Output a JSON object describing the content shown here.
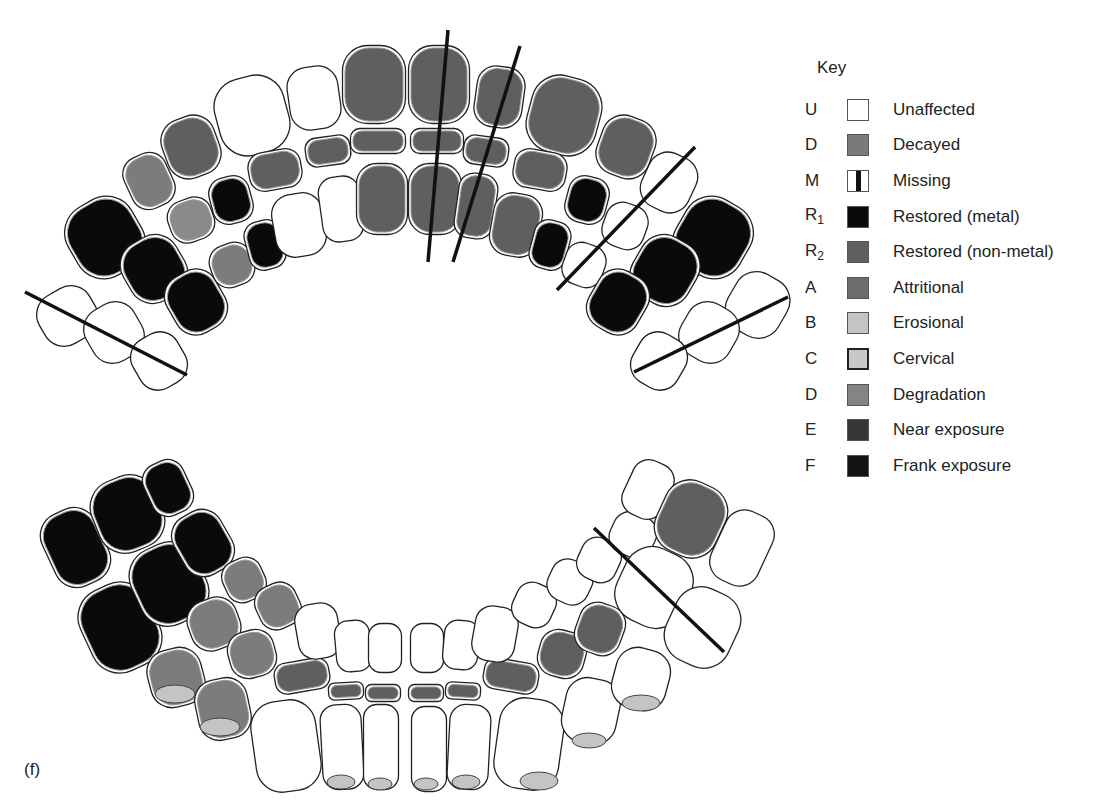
{
  "figure": {
    "panel_label": "(f)"
  },
  "legend": {
    "title": "Key",
    "items": [
      {
        "code": "U",
        "sub": "",
        "label": "Unaffected",
        "color": "#ffffff",
        "pattern": "outline"
      },
      {
        "code": "D",
        "sub": "",
        "label": "Decayed",
        "color": "#7a7a7a",
        "pattern": "solid"
      },
      {
        "code": "M",
        "sub": "",
        "label": "Missing",
        "color": "#ffffff",
        "pattern": "bar"
      },
      {
        "code": "R",
        "sub": "1",
        "label": "Restored (metal)",
        "color": "#0a0a0a",
        "pattern": "solid"
      },
      {
        "code": "R",
        "sub": "2",
        "label": "Restored (non-metal)",
        "color": "#5e5e5e",
        "pattern": "solid"
      },
      {
        "code": "A",
        "sub": "",
        "label": "Attritional",
        "color": "#6c6c6c",
        "pattern": "solid"
      },
      {
        "code": "B",
        "sub": "",
        "label": "Erosional",
        "color": "#c4c4c4",
        "pattern": "solid"
      },
      {
        "code": "C",
        "sub": "",
        "label": "Cervical",
        "color": "#c8c8c8",
        "pattern": "bordered"
      },
      {
        "code": "D",
        "sub": "",
        "label": "Degradation",
        "color": "#848484",
        "pattern": "solid"
      },
      {
        "code": "E",
        "sub": "",
        "label": "Near exposure",
        "color": "#363636",
        "pattern": "solid"
      },
      {
        "code": "F",
        "sub": "",
        "label": "Frank exposure",
        "color": "#121212",
        "pattern": "solid"
      }
    ]
  },
  "colors": {
    "outline": "#222222",
    "decayed": "#5f5f5f",
    "metal": "#0a0a0a",
    "erosional": "#c4c4c4",
    "attritional": "#7c7c7c",
    "missing_line": "#111111"
  },
  "upper_arch": {
    "teeth": [
      {
        "x": 40,
        "y": 290,
        "w": 55,
        "h": 52,
        "r": -30,
        "fill": "#ffffff"
      },
      {
        "x": 88,
        "y": 305,
        "w": 52,
        "h": 55,
        "r": -30,
        "fill": "#ffffff"
      },
      {
        "x": 135,
        "y": 335,
        "w": 48,
        "h": 52,
        "r": -30,
        "fill": "#ffffff"
      },
      {
        "x": 70,
        "y": 200,
        "w": 70,
        "h": 75,
        "r": -30,
        "fill": "#0a0a0a"
      },
      {
        "x": 125,
        "y": 238,
        "w": 58,
        "h": 62,
        "r": -30,
        "fill": "#0a0a0a"
      },
      {
        "x": 170,
        "y": 272,
        "w": 52,
        "h": 60,
        "r": -30,
        "fill": "#0a0a0a"
      },
      {
        "x": 128,
        "y": 155,
        "w": 42,
        "h": 52,
        "r": -25,
        "fill": "#7c7c7c"
      },
      {
        "x": 170,
        "y": 200,
        "w": 42,
        "h": 40,
        "r": -20,
        "fill": "#8a8a8a"
      },
      {
        "x": 212,
        "y": 245,
        "w": 40,
        "h": 40,
        "r": -20,
        "fill": "#7c7c7c"
      },
      {
        "x": 165,
        "y": 118,
        "w": 52,
        "h": 58,
        "r": -20,
        "fill": "#5f5f5f"
      },
      {
        "x": 212,
        "y": 178,
        "w": 38,
        "h": 44,
        "r": -15,
        "fill": "#0a0a0a"
      },
      {
        "x": 248,
        "y": 222,
        "w": 34,
        "h": 46,
        "r": -15,
        "fill": "#0a0a0a"
      },
      {
        "x": 218,
        "y": 78,
        "w": 68,
        "h": 75,
        "r": -15,
        "fill": "#ffffff"
      },
      {
        "x": 250,
        "y": 152,
        "w": 50,
        "h": 36,
        "r": -10,
        "fill": "#5f5f5f"
      },
      {
        "x": 275,
        "y": 195,
        "w": 48,
        "h": 60,
        "r": -10,
        "fill": "#ffffff"
      },
      {
        "x": 290,
        "y": 68,
        "w": 48,
        "h": 60,
        "r": -8,
        "fill": "#ffffff"
      },
      {
        "x": 307,
        "y": 138,
        "w": 42,
        "h": 26,
        "r": -8,
        "fill": "#5f5f5f"
      },
      {
        "x": 322,
        "y": 178,
        "w": 38,
        "h": 62,
        "r": -8,
        "fill": "#ffffff"
      },
      {
        "x": 344,
        "y": 47,
        "w": 60,
        "h": 75,
        "r": 0,
        "fill": "#5f5f5f"
      },
      {
        "x": 352,
        "y": 130,
        "w": 52,
        "h": 22,
        "r": 0,
        "fill": "#5f5f5f"
      },
      {
        "x": 358,
        "y": 165,
        "w": 48,
        "h": 68,
        "r": 0,
        "fill": "#5f5f5f"
      },
      {
        "x": 410,
        "y": 47,
        "w": 58,
        "h": 75,
        "r": 0,
        "fill": "#5f5f5f"
      },
      {
        "x": 412,
        "y": 130,
        "w": 50,
        "h": 22,
        "r": 0,
        "fill": "#5f5f5f"
      },
      {
        "x": 410,
        "y": 165,
        "w": 50,
        "h": 68,
        "r": 0,
        "fill": "#5f5f5f"
      },
      {
        "x": 477,
        "y": 68,
        "w": 45,
        "h": 58,
        "r": 8,
        "fill": "#5f5f5f"
      },
      {
        "x": 465,
        "y": 138,
        "w": 42,
        "h": 26,
        "r": 8,
        "fill": "#5f5f5f"
      },
      {
        "x": 458,
        "y": 175,
        "w": 36,
        "h": 62,
        "r": 8,
        "fill": "#5f5f5f"
      },
      {
        "x": 530,
        "y": 78,
        "w": 68,
        "h": 75,
        "r": 15,
        "fill": "#5f5f5f"
      },
      {
        "x": 515,
        "y": 152,
        "w": 50,
        "h": 36,
        "r": 10,
        "fill": "#5f5f5f"
      },
      {
        "x": 493,
        "y": 195,
        "w": 46,
        "h": 60,
        "r": 10,
        "fill": "#5f5f5f"
      },
      {
        "x": 600,
        "y": 118,
        "w": 52,
        "h": 58,
        "r": 20,
        "fill": "#5f5f5f"
      },
      {
        "x": 568,
        "y": 178,
        "w": 38,
        "h": 44,
        "r": 15,
        "fill": "#0a0a0a"
      },
      {
        "x": 533,
        "y": 222,
        "w": 34,
        "h": 46,
        "r": 15,
        "fill": "#0a0a0a"
      },
      {
        "x": 645,
        "y": 155,
        "w": 48,
        "h": 55,
        "r": 25,
        "fill": "#ffffff"
      },
      {
        "x": 605,
        "y": 205,
        "w": 40,
        "h": 42,
        "r": 20,
        "fill": "#ffffff"
      },
      {
        "x": 565,
        "y": 245,
        "w": 38,
        "h": 40,
        "r": 20,
        "fill": "#ffffff"
      },
      {
        "x": 678,
        "y": 200,
        "w": 70,
        "h": 75,
        "r": 30,
        "fill": "#0a0a0a"
      },
      {
        "x": 635,
        "y": 238,
        "w": 60,
        "h": 65,
        "r": 30,
        "fill": "#0a0a0a"
      },
      {
        "x": 592,
        "y": 272,
        "w": 52,
        "h": 60,
        "r": 30,
        "fill": "#0a0a0a"
      },
      {
        "x": 730,
        "y": 275,
        "w": 55,
        "h": 60,
        "r": 30,
        "fill": "#ffffff"
      },
      {
        "x": 683,
        "y": 305,
        "w": 52,
        "h": 55,
        "r": 30,
        "fill": "#ffffff"
      },
      {
        "x": 635,
        "y": 335,
        "w": 48,
        "h": 52,
        "r": 30,
        "fill": "#ffffff"
      }
    ],
    "missing_lines": [
      {
        "x1": 25,
        "y1": 292,
        "x2": 187,
        "y2": 375
      },
      {
        "x1": 448,
        "y1": 30,
        "x2": 428,
        "y2": 262
      },
      {
        "x1": 520,
        "y1": 46,
        "x2": 453,
        "y2": 262
      },
      {
        "x1": 695,
        "y1": 147,
        "x2": 557,
        "y2": 290
      },
      {
        "x1": 788,
        "y1": 297,
        "x2": 634,
        "y2": 372
      }
    ]
  },
  "lower_arch": {
    "teeth": [
      {
        "x": 48,
        "y": 510,
        "w": 55,
        "h": 75,
        "r": -25,
        "fill": "#0a0a0a"
      },
      {
        "x": 95,
        "y": 478,
        "w": 65,
        "h": 72,
        "r": -22,
        "fill": "#0a0a0a"
      },
      {
        "x": 148,
        "y": 462,
        "w": 40,
        "h": 52,
        "r": -25,
        "fill": "#0a0a0a"
      },
      {
        "x": 85,
        "y": 585,
        "w": 70,
        "h": 85,
        "r": -25,
        "fill": "#0a0a0a"
      },
      {
        "x": 135,
        "y": 545,
        "w": 68,
        "h": 78,
        "r": -25,
        "fill": "#0a0a0a"
      },
      {
        "x": 178,
        "y": 512,
        "w": 50,
        "h": 62,
        "r": -30,
        "fill": "#0a0a0a"
      },
      {
        "x": 225,
        "y": 560,
        "w": 38,
        "h": 40,
        "r": -25,
        "fill": "#7c7c7c"
      },
      {
        "x": 258,
        "y": 585,
        "w": 40,
        "h": 42,
        "r": -25,
        "fill": "#7c7c7c"
      },
      {
        "x": 190,
        "y": 600,
        "w": 48,
        "h": 48,
        "r": -20,
        "fill": "#7c7c7c"
      },
      {
        "x": 230,
        "y": 632,
        "w": 44,
        "h": 44,
        "r": -15,
        "fill": "#7c7c7c"
      },
      {
        "x": 150,
        "y": 650,
        "w": 52,
        "h": 55,
        "r": -15,
        "fill": "#7c7c7c"
      },
      {
        "x": 198,
        "y": 680,
        "w": 50,
        "h": 58,
        "r": -12,
        "fill": "#7c7c7c"
      },
      {
        "x": 276,
        "y": 662,
        "w": 52,
        "h": 28,
        "r": -10,
        "fill": "#5f5f5f"
      },
      {
        "x": 330,
        "y": 684,
        "w": 32,
        "h": 14,
        "r": -3,
        "fill": "#5f5f5f"
      },
      {
        "x": 367,
        "y": 686,
        "w": 32,
        "h": 14,
        "r": 0,
        "fill": "#5f5f5f"
      },
      {
        "x": 410,
        "y": 686,
        "w": 32,
        "h": 14,
        "r": 0,
        "fill": "#5f5f5f"
      },
      {
        "x": 447,
        "y": 684,
        "w": 32,
        "h": 14,
        "r": 3,
        "fill": "#5f5f5f"
      },
      {
        "x": 485,
        "y": 662,
        "w": 52,
        "h": 28,
        "r": 10,
        "fill": "#5f5f5f"
      },
      {
        "x": 298,
        "y": 605,
        "w": 40,
        "h": 52,
        "r": -10,
        "fill": "#ffffff"
      },
      {
        "x": 337,
        "y": 622,
        "w": 32,
        "h": 48,
        "r": -5,
        "fill": "#ffffff"
      },
      {
        "x": 370,
        "y": 625,
        "w": 30,
        "h": 46,
        "r": 0,
        "fill": "#ffffff"
      },
      {
        "x": 412,
        "y": 625,
        "w": 30,
        "h": 46,
        "r": 0,
        "fill": "#ffffff"
      },
      {
        "x": 445,
        "y": 622,
        "w": 32,
        "h": 46,
        "r": 5,
        "fill": "#ffffff"
      },
      {
        "x": 475,
        "y": 608,
        "w": 40,
        "h": 52,
        "r": 10,
        "fill": "#ffffff"
      },
      {
        "x": 255,
        "y": 702,
        "w": 62,
        "h": 88,
        "r": -8,
        "fill": "#ffffff"
      },
      {
        "x": 323,
        "y": 706,
        "w": 38,
        "h": 82,
        "r": -3,
        "fill": "#ffffff"
      },
      {
        "x": 365,
        "y": 706,
        "w": 32,
        "h": 82,
        "r": 0,
        "fill": "#ffffff"
      },
      {
        "x": 413,
        "y": 708,
        "w": 32,
        "h": 82,
        "r": 0,
        "fill": "#ffffff"
      },
      {
        "x": 450,
        "y": 706,
        "w": 38,
        "h": 82,
        "r": 3,
        "fill": "#ffffff"
      },
      {
        "x": 498,
        "y": 700,
        "w": 62,
        "h": 88,
        "r": 8,
        "fill": "#ffffff"
      },
      {
        "x": 565,
        "y": 680,
        "w": 52,
        "h": 62,
        "r": 12,
        "fill": "#ffffff"
      },
      {
        "x": 615,
        "y": 650,
        "w": 52,
        "h": 58,
        "r": 15,
        "fill": "#ffffff"
      },
      {
        "x": 540,
        "y": 632,
        "w": 44,
        "h": 44,
        "r": 15,
        "fill": "#5f5f5f"
      },
      {
        "x": 578,
        "y": 605,
        "w": 44,
        "h": 48,
        "r": 20,
        "fill": "#5f5f5f"
      },
      {
        "x": 515,
        "y": 585,
        "w": 38,
        "h": 40,
        "r": 25,
        "fill": "#ffffff"
      },
      {
        "x": 550,
        "y": 562,
        "w": 40,
        "h": 40,
        "r": 25,
        "fill": "#ffffff"
      },
      {
        "x": 580,
        "y": 540,
        "w": 38,
        "h": 40,
        "r": 25,
        "fill": "#ffffff"
      },
      {
        "x": 612,
        "y": 515,
        "w": 42,
        "h": 40,
        "r": 25,
        "fill": "#ffffff"
      },
      {
        "x": 620,
        "y": 550,
        "w": 68,
        "h": 75,
        "r": 25,
        "fill": "#ffffff"
      },
      {
        "x": 670,
        "y": 590,
        "w": 65,
        "h": 75,
        "r": 25,
        "fill": "#ffffff"
      },
      {
        "x": 628,
        "y": 462,
        "w": 40,
        "h": 55,
        "r": 25,
        "fill": "#ffffff"
      },
      {
        "x": 660,
        "y": 483,
        "w": 62,
        "h": 72,
        "r": 25,
        "fill": "#5f5f5f"
      },
      {
        "x": 718,
        "y": 512,
        "w": 48,
        "h": 72,
        "r": 25,
        "fill": "#ffffff"
      }
    ],
    "erosion_tips": [
      {
        "x": 155,
        "y": 685,
        "w": 40,
        "h": 18
      },
      {
        "x": 200,
        "y": 718,
        "w": 40,
        "h": 18
      },
      {
        "x": 327,
        "y": 775,
        "w": 28,
        "h": 14
      },
      {
        "x": 368,
        "y": 778,
        "w": 24,
        "h": 12
      },
      {
        "x": 414,
        "y": 778,
        "w": 24,
        "h": 12
      },
      {
        "x": 452,
        "y": 775,
        "w": 28,
        "h": 14
      },
      {
        "x": 520,
        "y": 772,
        "w": 38,
        "h": 18
      },
      {
        "x": 572,
        "y": 733,
        "w": 34,
        "h": 15
      },
      {
        "x": 622,
        "y": 695,
        "w": 38,
        "h": 16
      }
    ],
    "missing_lines": [
      {
        "x1": 594,
        "y1": 528,
        "x2": 724,
        "y2": 652
      }
    ]
  }
}
